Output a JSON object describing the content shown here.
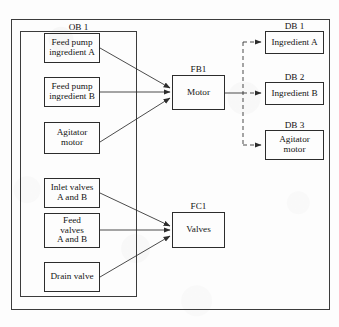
{
  "diagram": {
    "outer_frame_label": "",
    "ob_container": {
      "label": "OB 1"
    },
    "left_blocks": [
      {
        "id": "feed-pump-a",
        "lines": [
          "Feed pump",
          "ingredient A"
        ]
      },
      {
        "id": "feed-pump-b",
        "lines": [
          "Feed pump",
          "ingredient B"
        ]
      },
      {
        "id": "agitator-motor",
        "lines": [
          "Agitator",
          "motor"
        ]
      },
      {
        "id": "inlet-valves",
        "lines": [
          "Inlet valves",
          "A and B"
        ]
      },
      {
        "id": "feed-valves",
        "lines": [
          "Feed",
          "valves",
          "A and B"
        ]
      },
      {
        "id": "drain-valve",
        "lines": [
          "Drain valve"
        ]
      }
    ],
    "center_blocks": [
      {
        "id": "fb1",
        "caption": "FB1",
        "lines": [
          "Motor"
        ]
      },
      {
        "id": "fc1",
        "caption": "FC1",
        "lines": [
          "Valves"
        ]
      }
    ],
    "right_blocks": [
      {
        "id": "db1",
        "caption": "DB 1",
        "lines": [
          "Ingredient A"
        ]
      },
      {
        "id": "db2",
        "caption": "DB 2",
        "lines": [
          "Ingredient B"
        ]
      },
      {
        "id": "db3",
        "caption": "DB 3",
        "lines": [
          "Agitator",
          "motor"
        ]
      }
    ],
    "connections": [
      {
        "from": "feed-pump-a",
        "to": "fb1",
        "style": "solid-arrow"
      },
      {
        "from": "feed-pump-b",
        "to": "fb1",
        "style": "solid-arrow"
      },
      {
        "from": "agitator-motor",
        "to": "fb1",
        "style": "solid-arrow"
      },
      {
        "from": "inlet-valves",
        "to": "fc1",
        "style": "solid-arrow"
      },
      {
        "from": "feed-valves",
        "to": "fc1",
        "style": "solid-arrow"
      },
      {
        "from": "drain-valve",
        "to": "fc1",
        "style": "solid-arrow"
      },
      {
        "from": "fb1",
        "to": "db-bus",
        "style": "solid-line"
      },
      {
        "from": "db-bus",
        "to": "db1",
        "style": "dashed-arrow"
      },
      {
        "from": "db-bus",
        "to": "db2",
        "style": "dashed-arrow"
      },
      {
        "from": "db-bus",
        "to": "db3",
        "style": "dashed-arrow"
      }
    ],
    "colors": {
      "line": "#2c2c2c",
      "frame": "#3c3c3c",
      "background": "#fdfdfd",
      "text": "#141414"
    }
  }
}
